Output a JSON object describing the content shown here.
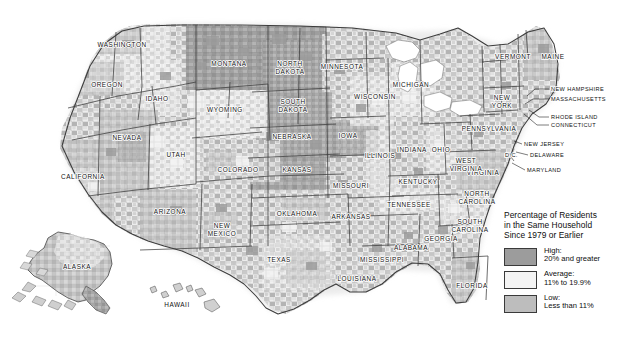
{
  "map": {
    "title_visible": false,
    "state_labels": [
      {
        "name": "WASHINGTON",
        "x": 122,
        "y": 47,
        "lines": [
          "WASHINGTON"
        ]
      },
      {
        "name": "OREGON",
        "x": 107,
        "y": 87,
        "lines": [
          "OREGON"
        ]
      },
      {
        "name": "IDAHO",
        "x": 157,
        "y": 101,
        "lines": [
          "IDAHO"
        ]
      },
      {
        "name": "MONTANA",
        "x": 229,
        "y": 66,
        "lines": [
          "MONTANA"
        ]
      },
      {
        "name": "WYOMING",
        "x": 225,
        "y": 112,
        "lines": [
          "WYOMING"
        ]
      },
      {
        "name": "NEVADA",
        "x": 127,
        "y": 140,
        "lines": [
          "NEVADA"
        ]
      },
      {
        "name": "UTAH",
        "x": 176,
        "y": 157,
        "lines": [
          "UTAH"
        ]
      },
      {
        "name": "CALIFORNIA",
        "x": 83,
        "y": 179,
        "lines": [
          "CALIFORNIA"
        ]
      },
      {
        "name": "ARIZONA",
        "x": 170,
        "y": 214,
        "lines": [
          "ARIZONA"
        ]
      },
      {
        "name": "NEW MEXICO",
        "x": 222,
        "y": 228,
        "lines": [
          "NEW",
          "MEXICO"
        ]
      },
      {
        "name": "COLORADO",
        "x": 238,
        "y": 172,
        "lines": [
          "COLORADO"
        ]
      },
      {
        "name": "NORTH DAKOTA",
        "x": 290,
        "y": 66,
        "lines": [
          "NORTH",
          "DAKOTA"
        ]
      },
      {
        "name": "SOUTH DAKOTA",
        "x": 293,
        "y": 104,
        "lines": [
          "SOUTH",
          "DAKOTA"
        ]
      },
      {
        "name": "NEBRASKA",
        "x": 292,
        "y": 139,
        "lines": [
          "NEBRASKA"
        ]
      },
      {
        "name": "KANSAS",
        "x": 297,
        "y": 172,
        "lines": [
          "KANSAS"
        ]
      },
      {
        "name": "OKLAHOMA",
        "x": 297,
        "y": 216,
        "lines": [
          "OKLAHOMA"
        ]
      },
      {
        "name": "TEXAS",
        "x": 279,
        "y": 262,
        "lines": [
          "TEXAS"
        ]
      },
      {
        "name": "MINNESOTA",
        "x": 342,
        "y": 69,
        "lines": [
          "MINNESOTA"
        ]
      },
      {
        "name": "IOWA",
        "x": 348,
        "y": 138,
        "lines": [
          "IOWA"
        ]
      },
      {
        "name": "MISSOURI",
        "x": 351,
        "y": 188,
        "lines": [
          "MISSOURI"
        ]
      },
      {
        "name": "ARKANSAS",
        "x": 351,
        "y": 219,
        "lines": [
          "ARKANSAS"
        ]
      },
      {
        "name": "LOUISIANA",
        "x": 357,
        "y": 281,
        "lines": [
          "LOUISIANA"
        ]
      },
      {
        "name": "WISCONSIN",
        "x": 375,
        "y": 99,
        "lines": [
          "WISCONSIN"
        ]
      },
      {
        "name": "ILLINOIS",
        "x": 380,
        "y": 158,
        "lines": [
          "ILLINOIS"
        ]
      },
      {
        "name": "MICHIGAN",
        "x": 411,
        "y": 87,
        "lines": [
          "MICHIGAN"
        ]
      },
      {
        "name": "INDIANA",
        "x": 412,
        "y": 152,
        "lines": [
          "INDIANA"
        ]
      },
      {
        "name": "OHIO",
        "x": 441,
        "y": 152,
        "lines": [
          "OHIO"
        ]
      },
      {
        "name": "KENTUCKY",
        "x": 418,
        "y": 184,
        "lines": [
          "KENTUCKY"
        ]
      },
      {
        "name": "TENNESSEE",
        "x": 409,
        "y": 207,
        "lines": [
          "TENNESSEE"
        ]
      },
      {
        "name": "MISSISSIPPI",
        "x": 382,
        "y": 262,
        "lines": [
          "MISSISSIPPI"
        ]
      },
      {
        "name": "ALABAMA",
        "x": 411,
        "y": 250,
        "lines": [
          "ALABAMA"
        ]
      },
      {
        "name": "GEORGIA",
        "x": 441,
        "y": 241,
        "lines": [
          "GEORGIA"
        ]
      },
      {
        "name": "FLORIDA",
        "x": 472,
        "y": 288,
        "lines": [
          "FLORIDA"
        ]
      },
      {
        "name": "SOUTH CAROLINA",
        "x": 470,
        "y": 224,
        "lines": [
          "SOUTH",
          "CAROLINA"
        ]
      },
      {
        "name": "NORTH CAROLINA",
        "x": 477,
        "y": 196,
        "lines": [
          "NORTH",
          "CAROLINA"
        ]
      },
      {
        "name": "VIRGINIA",
        "x": 483,
        "y": 175,
        "lines": [
          "VIRGINIA"
        ]
      },
      {
        "name": "WEST VIRGINIA",
        "x": 466,
        "y": 163,
        "lines": [
          "WEST",
          "VIRGINIA"
        ]
      },
      {
        "name": "PENNSYLVANIA",
        "x": 489,
        "y": 131,
        "lines": [
          "PENNSYLVANIA"
        ]
      },
      {
        "name": "NEW YORK",
        "x": 502,
        "y": 100,
        "lines": [
          "NEW",
          "YORK"
        ]
      },
      {
        "name": "VERMONT",
        "x": 513,
        "y": 59,
        "lines": [
          "VERMONT"
        ]
      },
      {
        "name": "MAINE",
        "x": 553,
        "y": 59,
        "lines": [
          "MAINE"
        ]
      },
      {
        "name": "ALASKA",
        "x": 77,
        "y": 269,
        "lines": [
          "ALASKA"
        ]
      },
      {
        "name": "HAWAII",
        "x": 177,
        "y": 307,
        "lines": [
          "HAWAII"
        ]
      }
    ],
    "callout_labels": [
      {
        "name": "NEW HAMPSHIRE",
        "text": "NEW HAMPSHIRE",
        "x": 551,
        "y": 91,
        "leader": "M549,89 L535,89 L527,96"
      },
      {
        "name": "MASSACHUSETTS",
        "text": "MASSACHUSETTS",
        "x": 551,
        "y": 101,
        "leader": "M549,99 L533,99 L525,104"
      },
      {
        "name": "RHODE ISLAND",
        "text": "RHODE ISLAND",
        "x": 551,
        "y": 119,
        "leader": "M549,117 L539,117 L529,110"
      },
      {
        "name": "CONNECTICUT",
        "text": "CONNECTICUT",
        "x": 551,
        "y": 127,
        "leader": "M549,125 L537,125 L524,114"
      },
      {
        "name": "NEW JERSEY",
        "text": "NEW JERSEY",
        "x": 524,
        "y": 146,
        "leader": "M522,144 L514,141"
      },
      {
        "name": "DELAWARE",
        "text": "DELAWARE",
        "x": 530,
        "y": 157,
        "leader": "M528,155 L516,152"
      },
      {
        "name": "MARYLAND",
        "text": "MARYLAND",
        "x": 527,
        "y": 172,
        "leader": "M525,170 L512,163"
      },
      {
        "name": "D.C.",
        "text": "D.C.",
        "x": 505,
        "y": 157,
        "leader": "M511,157 L514,161"
      }
    ],
    "legend": {
      "title_lines": [
        "Percentage of Residents",
        "in the Same Household",
        "Since 1979 or Earlier"
      ],
      "entries": [
        {
          "key": "high",
          "label": "High:",
          "range": "20% and greater",
          "color": "#9c9c9c"
        },
        {
          "key": "average",
          "label": "Average:",
          "range": "11% to 19.9%",
          "color": "#f2f2f2"
        },
        {
          "key": "low",
          "label": "Low:",
          "range": "Less than 11%",
          "color": "#bdbdbd"
        }
      ]
    },
    "colors": {
      "high": "#9c9c9c",
      "average": "#f2f2f2",
      "low": "#c2c2c2",
      "water": "#ffffff",
      "county_line": "#b6b6b6",
      "state_line": "#3c3c3c",
      "background": "#ffffff",
      "halo": "#e8e8e8"
    }
  }
}
